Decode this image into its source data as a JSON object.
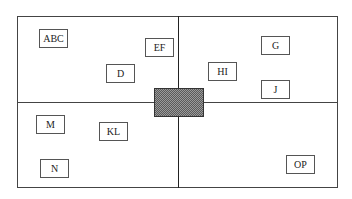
{
  "diagram": {
    "type": "quadrant-layout",
    "outer_border_color": "#444444",
    "center_block": {
      "pattern": "checkerboard-hatch",
      "x": 154,
      "y": 88,
      "width": 50,
      "height": 29
    },
    "quadrants": {
      "top_left": [
        "ABC",
        "EF",
        "D"
      ],
      "top_right": [
        "G",
        "HI",
        "J"
      ],
      "bottom_left": [
        "M",
        "KL",
        "N"
      ],
      "bottom_right": [
        "OP"
      ]
    },
    "boxes": [
      {
        "id": "abc",
        "label": "ABC",
        "x": 39,
        "y": 29
      },
      {
        "id": "ef",
        "label": "EF",
        "x": 145,
        "y": 38
      },
      {
        "id": "d",
        "label": "D",
        "x": 106,
        "y": 64
      },
      {
        "id": "g",
        "label": "G",
        "x": 261,
        "y": 36
      },
      {
        "id": "hi",
        "label": "HI",
        "x": 208,
        "y": 62
      },
      {
        "id": "j",
        "label": "J",
        "x": 261,
        "y": 80
      },
      {
        "id": "m",
        "label": "M",
        "x": 36,
        "y": 115
      },
      {
        "id": "kl",
        "label": "KL",
        "x": 99,
        "y": 122
      },
      {
        "id": "n",
        "label": "N",
        "x": 40,
        "y": 159
      },
      {
        "id": "op",
        "label": "OP",
        "x": 286,
        "y": 155
      }
    ]
  }
}
